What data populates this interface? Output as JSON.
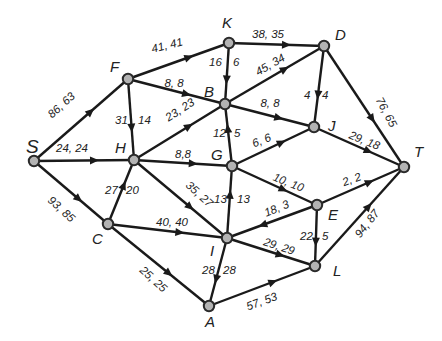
{
  "diagram": {
    "type": "network-flow",
    "nodes": [
      {
        "id": "S",
        "label": "S",
        "x": 34,
        "y": 161,
        "lx": 26,
        "ly": 153,
        "big": true
      },
      {
        "id": "F",
        "label": "F",
        "x": 128,
        "y": 79,
        "lx": 110,
        "ly": 72
      },
      {
        "id": "K",
        "label": "K",
        "x": 229,
        "y": 43,
        "lx": 222,
        "ly": 28
      },
      {
        "id": "D",
        "label": "D",
        "x": 324,
        "y": 46,
        "lx": 335,
        "ly": 40
      },
      {
        "id": "B",
        "label": "B",
        "x": 225,
        "y": 104,
        "lx": 204,
        "ly": 97
      },
      {
        "id": "H",
        "label": "H",
        "x": 134,
        "y": 160,
        "lx": 115,
        "ly": 153
      },
      {
        "id": "G",
        "label": "G",
        "x": 232,
        "y": 166,
        "lx": 211,
        "ly": 160
      },
      {
        "id": "J",
        "label": "J",
        "x": 314,
        "y": 127,
        "lx": 328,
        "ly": 131
      },
      {
        "id": "T",
        "label": "T",
        "x": 404,
        "y": 167,
        "lx": 414,
        "ly": 157
      },
      {
        "id": "C",
        "label": "C",
        "x": 108,
        "y": 224,
        "lx": 92,
        "ly": 244
      },
      {
        "id": "I",
        "label": "I",
        "x": 227,
        "y": 238,
        "lx": 210,
        "ly": 256
      },
      {
        "id": "E",
        "label": "E",
        "x": 317,
        "y": 205,
        "lx": 328,
        "ly": 220
      },
      {
        "id": "L",
        "label": "L",
        "x": 315,
        "y": 266,
        "lx": 333,
        "ly": 276
      },
      {
        "id": "A",
        "label": "A",
        "x": 209,
        "y": 306,
        "lx": 205,
        "ly": 327
      }
    ],
    "edges": [
      {
        "from": "S",
        "to": "F",
        "capacity": 86,
        "flow": 63,
        "label": "86, 63",
        "lx": 64,
        "ly": 108,
        "rot": -42
      },
      {
        "from": "S",
        "to": "H",
        "capacity": 24,
        "flow": 24,
        "label": "24, 24",
        "lx": 72,
        "ly": 152,
        "rot": 0
      },
      {
        "from": "S",
        "to": "C",
        "capacity": 93,
        "flow": 85,
        "label": "93, 85",
        "lx": 59,
        "ly": 212,
        "rot": 42
      },
      {
        "from": "F",
        "to": "K",
        "capacity": 41,
        "flow": 41,
        "label": "41, 41",
        "lx": 168,
        "ly": 49,
        "rot": -14
      },
      {
        "from": "F",
        "to": "B",
        "capacity": 8,
        "flow": 8,
        "label": "8, 8",
        "lx": 174,
        "ly": 87,
        "rot": 0
      },
      {
        "from": "F",
        "to": "H",
        "capacity": 31,
        "flow": 14,
        "label": "31, 14",
        "lx": 118,
        "ly": 124,
        "rot": 0,
        "split": true,
        "a": "31",
        "b": "14",
        "ax": 115,
        "bx": 138
      },
      {
        "from": "K",
        "to": "D",
        "capacity": 38,
        "flow": 35,
        "label": "38, 35",
        "lx": 268,
        "ly": 38,
        "rot": 0
      },
      {
        "from": "K",
        "to": "B",
        "capacity": 16,
        "flow": 6,
        "label": "16, 6",
        "lx": 213,
        "ly": 66,
        "rot": 0,
        "split": true,
        "a": "16",
        "b": "6",
        "ax": 209,
        "bx": 233
      },
      {
        "from": "B",
        "to": "D",
        "capacity": 45,
        "flow": 34,
        "label": "45, 34",
        "lx": 272,
        "ly": 68,
        "rot": -30
      },
      {
        "from": "H",
        "to": "B",
        "capacity": 23,
        "flow": 23,
        "label": "23, 23",
        "lx": 182,
        "ly": 113,
        "rot": -33
      },
      {
        "from": "B",
        "to": "J",
        "capacity": 8,
        "flow": 8,
        "label": "8, 8",
        "lx": 270,
        "ly": 107,
        "rot": 0
      },
      {
        "from": "D",
        "to": "J",
        "capacity": 4,
        "flow": 4,
        "label": "4, 4",
        "lx": 318,
        "ly": 99,
        "rot": 0,
        "split": true,
        "a": "4",
        "b": "4",
        "ax": 304,
        "bx": 322
      },
      {
        "from": "D",
        "to": "T",
        "capacity": 76,
        "flow": 65,
        "label": "76, 65",
        "lx": 383,
        "ly": 114,
        "rot": 62
      },
      {
        "from": "G",
        "to": "B",
        "capacity": 12,
        "flow": 5,
        "label": "12, 5",
        "lx": 228,
        "ly": 137,
        "rot": 0,
        "split": true,
        "a": "12",
        "b": "5",
        "ax": 213,
        "bx": 234
      },
      {
        "from": "H",
        "to": "G",
        "capacity": 8,
        "flow": 8,
        "label": "8,8",
        "lx": 183,
        "ly": 158,
        "rot": 0
      },
      {
        "from": "G",
        "to": "J",
        "capacity": 6,
        "flow": 6,
        "label": "6, 6",
        "lx": 263,
        "ly": 144,
        "rot": -22
      },
      {
        "from": "J",
        "to": "T",
        "capacity": 29,
        "flow": 18,
        "label": "29, 18",
        "lx": 363,
        "ly": 144,
        "rot": 22
      },
      {
        "from": "C",
        "to": "H",
        "capacity": 27,
        "flow": 20,
        "label": "27, 20",
        "lx": 120,
        "ly": 194,
        "rot": 0,
        "split": true,
        "a": "27",
        "b": "20",
        "ax": 105,
        "bx": 126
      },
      {
        "from": "H",
        "to": "I",
        "capacity": 35,
        "flow": 27,
        "label": "35, 27",
        "lx": 197,
        "ly": 197,
        "rot": 42
      },
      {
        "from": "I",
        "to": "G",
        "capacity": 13,
        "flow": 13,
        "label": "13, 13",
        "lx": 228,
        "ly": 203,
        "rot": 0,
        "split": true,
        "a": "13",
        "b": "13",
        "ax": 214,
        "bx": 237
      },
      {
        "from": "G",
        "to": "E",
        "capacity": 10,
        "flow": 10,
        "label": "10, 10",
        "lx": 287,
        "ly": 186,
        "rot": 22
      },
      {
        "from": "E",
        "to": "T",
        "capacity": 2,
        "flow": 2,
        "label": "2, 2",
        "lx": 353,
        "ly": 183,
        "rot": -20
      },
      {
        "from": "C",
        "to": "I",
        "capacity": 40,
        "flow": 40,
        "label": "40, 40",
        "lx": 172,
        "ly": 226,
        "rot": 0
      },
      {
        "from": "E",
        "to": "I",
        "capacity": 18,
        "flow": 3,
        "label": "18, 3",
        "lx": 278,
        "ly": 212,
        "rot": -22
      },
      {
        "from": "I",
        "to": "L",
        "capacity": 29,
        "flow": 29,
        "label": "29, 29",
        "lx": 278,
        "ly": 250,
        "rot": 18
      },
      {
        "from": "E",
        "to": "L",
        "capacity": 22,
        "flow": 5,
        "label": "22, 5",
        "lx": 318,
        "ly": 240,
        "rot": 0,
        "split": true,
        "a": "22",
        "b": "5",
        "ax": 300,
        "bx": 322
      },
      {
        "from": "L",
        "to": "T",
        "capacity": 94,
        "flow": 87,
        "label": "94, 87",
        "lx": 370,
        "ly": 226,
        "rot": -52
      },
      {
        "from": "C",
        "to": "A",
        "capacity": 25,
        "flow": 25,
        "label": "25, 25",
        "lx": 151,
        "ly": 282,
        "rot": 42
      },
      {
        "from": "I",
        "to": "A",
        "capacity": 28,
        "flow": 28,
        "label": "28, 28",
        "lx": 218,
        "ly": 274,
        "rot": 0,
        "split": true,
        "a": "28",
        "b": "28",
        "ax": 202,
        "bx": 223
      },
      {
        "from": "A",
        "to": "L",
        "capacity": 57,
        "flow": 53,
        "label": "57, 53",
        "lx": 263,
        "ly": 305,
        "rot": -20
      }
    ]
  }
}
